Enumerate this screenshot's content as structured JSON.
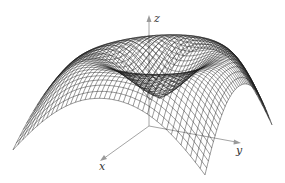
{
  "figure": {
    "axes": {
      "x_label": "x",
      "y_label": "y",
      "z_label": "z"
    },
    "surface": {
      "grid_lines": 40,
      "domain": [
        -1,
        1
      ],
      "shape": "radial ring: rises from a shallow central dip to a circular crest, then falls toward the square corners"
    },
    "colors": {
      "mesh": "#1a1a1a",
      "axes": "#9a9a9a",
      "background": "#ffffff"
    }
  }
}
